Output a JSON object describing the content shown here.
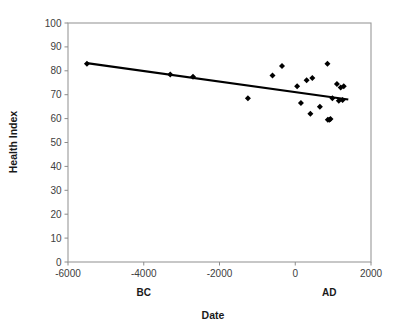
{
  "chart_data": {
    "type": "scatter",
    "title": "",
    "xlabel": "Date",
    "ylabel": "Health Index",
    "xlim": [
      -6000,
      2000
    ],
    "ylim": [
      0,
      100
    ],
    "grid": false,
    "legend": "none",
    "xticks": [
      "-6000",
      "-4000",
      "-2000",
      "0",
      "2000"
    ],
    "xtick_values": [
      -6000,
      -4000,
      -2000,
      0,
      2000
    ],
    "yticks": [
      "0",
      "10",
      "20",
      "30",
      "40",
      "50",
      "60",
      "70",
      "80",
      "90",
      "100"
    ],
    "ytick_values": [
      0,
      10,
      20,
      30,
      40,
      50,
      60,
      70,
      80,
      90,
      100
    ],
    "era_annotations": [
      {
        "label": "BC",
        "x": -4000
      },
      {
        "label": "AD",
        "x": 900
      }
    ],
    "series": [
      {
        "name": "Health Index",
        "marker": "diamond",
        "color": "#000000",
        "points": [
          {
            "x": -5500,
            "y": 83
          },
          {
            "x": -3300,
            "y": 78.5
          },
          {
            "x": -2700,
            "y": 77.5
          },
          {
            "x": -1250,
            "y": 68.5
          },
          {
            "x": -600,
            "y": 78
          },
          {
            "x": -350,
            "y": 82
          },
          {
            "x": 50,
            "y": 73.5
          },
          {
            "x": 150,
            "y": 66.5
          },
          {
            "x": 300,
            "y": 76
          },
          {
            "x": 400,
            "y": 62
          },
          {
            "x": 450,
            "y": 77
          },
          {
            "x": 650,
            "y": 65
          },
          {
            "x": 850,
            "y": 83
          },
          {
            "x": 860,
            "y": 59.5
          },
          {
            "x": 900,
            "y": 59.5
          },
          {
            "x": 930,
            "y": 59.8
          },
          {
            "x": 980,
            "y": 68.5
          },
          {
            "x": 1100,
            "y": 74.5
          },
          {
            "x": 1150,
            "y": 67.5
          },
          {
            "x": 1200,
            "y": 73
          },
          {
            "x": 1250,
            "y": 67.8
          },
          {
            "x": 1280,
            "y": 73.5
          }
        ]
      }
    ],
    "trendline": {
      "name": "linear-fit",
      "color": "#000000",
      "x_start": -5500,
      "y_start": 83.2,
      "x_end": 1400,
      "y_end": 68.0
    }
  }
}
